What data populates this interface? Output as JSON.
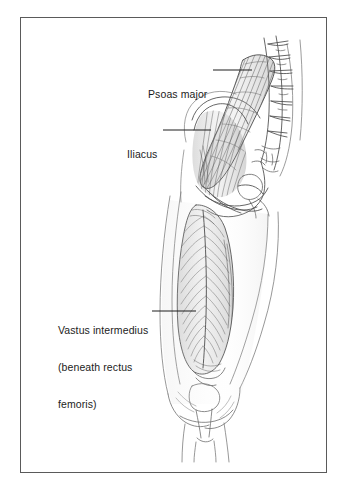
{
  "figure": {
    "kind": "anatomical-illustration",
    "style": "pencil line drawing",
    "background_color": "#ffffff",
    "frame_color": "#5a5a5a",
    "ink_color": "#4a4a4a",
    "text_color": "#1c1c1c"
  },
  "labels": [
    {
      "id": "psoas-major",
      "lines": [
        "Psoas major"
      ],
      "leader": {
        "from_x": 213,
        "from_y": 70,
        "to_x": 252,
        "to_y": 70
      }
    },
    {
      "id": "iliacus",
      "lines": [
        "Iliacus"
      ],
      "leader": {
        "from_x": 163,
        "from_y": 130,
        "to_x": 211,
        "to_y": 130
      }
    },
    {
      "id": "vastus-intermedius",
      "lines": [
        "Vastus intermedius",
        "(beneath rectus",
        "femoris)"
      ],
      "leader": {
        "from_x": 152,
        "from_y": 311,
        "to_x": 196,
        "to_y": 311
      }
    }
  ],
  "label_text": {
    "psoas_major_l1": "Psoas major",
    "iliacus_l1": "Iliacus",
    "vastus_l1": "Vastus intermedius",
    "vastus_l2": "(beneath rectus",
    "vastus_l3": "femoris)"
  },
  "structures": [
    "lumbar vertebral column with transverse processes",
    "psoas major muscle",
    "iliacus muscle over iliac fossa",
    "ilium / pelvic brim",
    "femoral head and greater trochanter region",
    "vastus intermedius muscle with pennate fibers",
    "thigh soft tissue outline",
    "knee with patella and femoral condyles",
    "proximal tibia and fibula"
  ]
}
